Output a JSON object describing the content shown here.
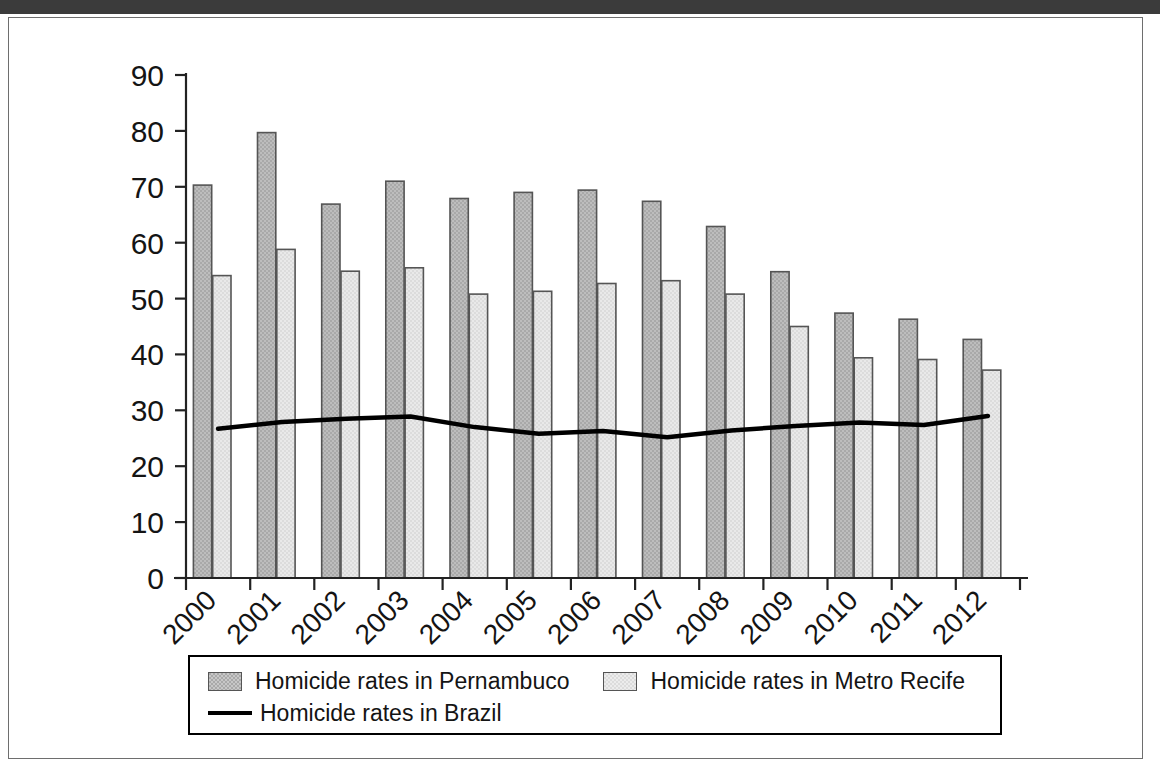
{
  "figure": {
    "frame_color": "#6e6e6e",
    "background": "#ffffff"
  },
  "legend": {
    "entries": [
      {
        "label": "Homicide rates in Pernambuco",
        "marker": "bar-swatch-dark",
        "color": "#a9a9a9"
      },
      {
        "label": "Homicide rates in Metro Recife",
        "marker": "bar-swatch-light",
        "color": "#dcdcdc"
      },
      {
        "label": "Homicide rates in Brazil",
        "marker": "line-sample",
        "color": "#000000"
      }
    ]
  },
  "chart_data": {
    "type": "bar",
    "title": "",
    "subtitle": "",
    "xlabel": "",
    "ylabel": "",
    "categories": [
      "2000",
      "2001",
      "2002",
      "2003",
      "2004",
      "2005",
      "2006",
      "2007",
      "2008",
      "2009",
      "2010",
      "2011",
      "2012"
    ],
    "ylim": [
      0,
      90
    ],
    "yticks": [
      0,
      10,
      20,
      30,
      40,
      50,
      60,
      70,
      80,
      90
    ],
    "ytick_labels": [
      "0",
      "10",
      "20",
      "30",
      "40",
      "50",
      "60",
      "70",
      "80",
      "90"
    ],
    "grid": false,
    "legend_position": "bottom",
    "xtick_label_rotation": 45,
    "series": [
      {
        "name": "Homicide rates in Pernambuco",
        "type": "bar",
        "color": "#a9a9a9",
        "edge_color": "#555555",
        "values": [
          70.3,
          79.7,
          66.9,
          71.0,
          67.9,
          69.0,
          69.4,
          67.4,
          62.9,
          54.8,
          47.4,
          46.3,
          42.7
        ]
      },
      {
        "name": "Homicide rates in Metro Recife",
        "type": "bar",
        "color": "#dcdcdc",
        "edge_color": "#555555",
        "values": [
          54.1,
          58.8,
          54.9,
          55.5,
          50.8,
          51.3,
          52.7,
          53.2,
          50.8,
          45.0,
          39.4,
          39.1,
          37.2
        ]
      },
      {
        "name": "Homicide rates in Brazil",
        "type": "line",
        "color": "#000000",
        "values": [
          26.7,
          27.9,
          28.5,
          28.9,
          27.0,
          25.8,
          26.3,
          25.2,
          26.4,
          27.2,
          27.8,
          27.4,
          29.0
        ]
      }
    ]
  }
}
